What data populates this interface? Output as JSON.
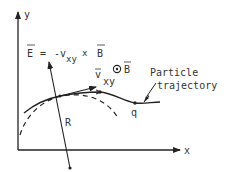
{
  "diagram": {
    "axes": {
      "x_label": "x",
      "y_label": "y"
    },
    "equation": {
      "lhs": "E",
      "equals": "=",
      "minus_v": "-v",
      "v_sub": "xy",
      "cross": "x",
      "rhs": "B"
    },
    "velocity_label": {
      "symbol": "v",
      "subscript": "xy"
    },
    "field_label": {
      "symbol_glyph": "⊙",
      "symbol": "B"
    },
    "radius_label": "R",
    "charge_label": "q",
    "trajectory_label": {
      "line1": "Particle",
      "line2": "trajectory"
    },
    "colors": {
      "ink": "#222222",
      "background": "#ffffff"
    }
  }
}
